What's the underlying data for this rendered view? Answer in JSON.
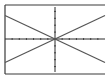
{
  "colors": {
    "background": "#ffffff",
    "frame": "#3a3a3a",
    "axis": "#2a2a2a",
    "line": "#555555"
  },
  "chart_data": {
    "type": "line",
    "title": "",
    "xlabel": "",
    "ylabel": "",
    "xlim": [
      -7,
      7
    ],
    "ylim": [
      -5,
      5
    ],
    "grid": false,
    "legend": "none",
    "axis_ticks": {
      "x_step": 1,
      "y_step": 1
    },
    "series": [
      {
        "name": "y = 0.5x",
        "x": [
          -7,
          7
        ],
        "values": [
          -3.4,
          3.4
        ]
      },
      {
        "name": "y = -0.5x",
        "x": [
          -7,
          7
        ],
        "values": [
          3.4,
          -3.4
        ]
      }
    ]
  }
}
